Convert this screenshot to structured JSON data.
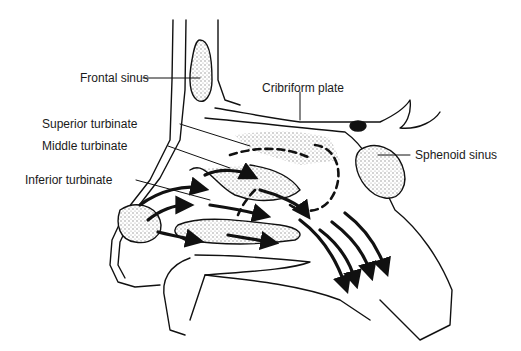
{
  "diagram": {
    "labels": {
      "frontal_sinus": "Frontal sinus",
      "cribriform_plate": "Cribriform plate",
      "superior_turbinate": "Superior turbinate",
      "middle_turbinate": "Middle turbinate",
      "inferior_turbinate": "Inferior turbinate",
      "sphenoid_sinus": "Sphenoid sinus"
    },
    "colors": {
      "line": "#111111",
      "stipple": "#bdbdbd",
      "background": "#ffffff"
    }
  }
}
